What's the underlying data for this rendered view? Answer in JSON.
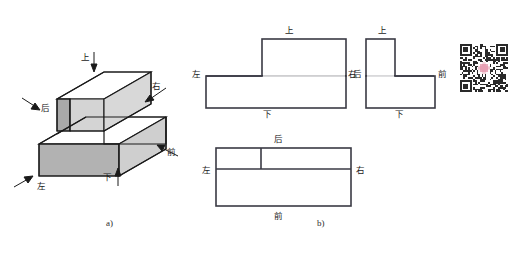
{
  "figure": {
    "caption_a": "a)",
    "caption_b": "b)"
  },
  "directions": {
    "top": "上",
    "bottom": "下",
    "left": "左",
    "right": "右",
    "front": "前",
    "back": "后"
  },
  "isometric": {
    "labels": [
      {
        "key": "top",
        "text": "上",
        "x": 79,
        "y": 57,
        "arrow": "down"
      },
      {
        "key": "back",
        "text": "后",
        "x": 40,
        "y": 104,
        "arrow": "up-right"
      },
      {
        "key": "right",
        "text": "右",
        "x": 150,
        "y": 94,
        "arrow": "down-left"
      },
      {
        "key": "front",
        "text": "前",
        "x": 166,
        "y": 149,
        "arrow": "up-left"
      },
      {
        "key": "left",
        "text": "左",
        "x": 37,
        "y": 177,
        "arrow": "up-right"
      },
      {
        "key": "bottom",
        "text": "下",
        "x": 104,
        "y": 176,
        "arrow": "up"
      }
    ]
  },
  "views": {
    "front_view": {
      "name": "front-view",
      "labels": {
        "top": "上",
        "left": "左",
        "right": "右",
        "bottom": "下"
      }
    },
    "side_view": {
      "name": "side-view",
      "labels": {
        "top": "上",
        "back": "后",
        "front": "前",
        "bottom": "下"
      }
    },
    "top_view": {
      "name": "top-view",
      "labels": {
        "back": "后",
        "left": "左",
        "right": "右",
        "front": "前"
      }
    }
  },
  "colors": {
    "outline": "#1a1a1a",
    "face_top": "#ffffff",
    "face_left_dark": "#a9a9a9",
    "face_right_light": "#d2d2d2",
    "face_side_mid": "#bdbdbd",
    "view_line": "#3a3a44",
    "background": "#ffffff",
    "qr_dark": "#2a2a2a",
    "qr_logo": "#e8a0b4"
  },
  "qr": {
    "name": "qr-code",
    "alt": "qr-code"
  }
}
